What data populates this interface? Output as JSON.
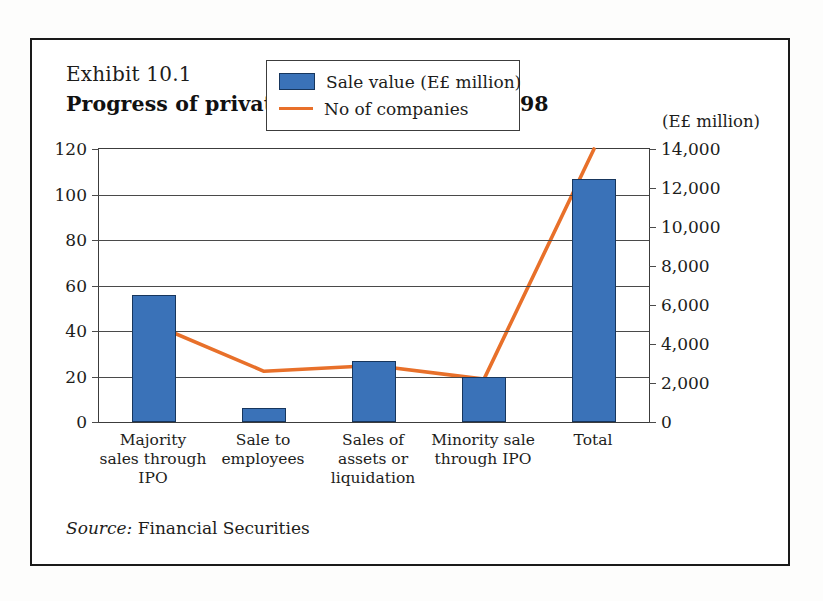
{
  "exhibit": {
    "number_label": "Exhibit 10.1",
    "title": "Progress of privatisation, December 1998",
    "unit_label": "(E£ million)",
    "source_prefix": "Source:",
    "source_text": "Financial Securities"
  },
  "legend": {
    "bar_series_label": "Sale value (E£ million)",
    "line_series_label": "No of companies",
    "bar_color": "#3a72b8",
    "bar_border_color": "#17365d",
    "line_color": "#e8702a"
  },
  "chart_data": {
    "type": "bar",
    "title": "Progress of privatisation, December 1998",
    "subtitle": "Exhibit 10.1",
    "xlabel": "",
    "ylabel": "",
    "grid": true,
    "legend_position": "inside-top-center",
    "categories": [
      "Majority sales through IPO",
      "Sale to employees",
      "Sales of assets or liquidation",
      "Minority sale through IPO",
      "Total"
    ],
    "category_lines": [
      [
        "Majority",
        "sales through",
        "IPO"
      ],
      [
        "Sale to",
        "employees"
      ],
      [
        "Sales of",
        "assets or",
        "liquidation"
      ],
      [
        "Minority sale",
        "through IPO"
      ],
      [
        "Total"
      ]
    ],
    "series": [
      {
        "name": "Sale value (E£ million)",
        "type": "bar",
        "axis": "left",
        "color": "#3a72b8",
        "values": [
          56,
          6,
          27,
          20,
          107
        ]
      },
      {
        "name": "No of companies",
        "type": "line",
        "axis": "right",
        "color": "#e8702a",
        "values": [
          5000,
          2600,
          2900,
          2200,
          14000
        ]
      }
    ],
    "left_axis": {
      "label": "",
      "ylim": [
        0,
        120
      ],
      "tick_step": 20,
      "ticks": [
        0,
        20,
        40,
        60,
        80,
        100,
        120
      ],
      "tick_labels": [
        "0",
        "20",
        "40",
        "60",
        "80",
        "100",
        "120"
      ]
    },
    "right_axis": {
      "label": "",
      "ylim": [
        0,
        14000
      ],
      "tick_step": 2000,
      "ticks": [
        0,
        2000,
        4000,
        6000,
        8000,
        10000,
        12000,
        14000
      ],
      "tick_labels": [
        "0",
        "2,000",
        "4,000",
        "6,000",
        "8,000",
        "10,000",
        "12,000",
        "14,000"
      ]
    },
    "source": "Source: Financial Securities"
  }
}
